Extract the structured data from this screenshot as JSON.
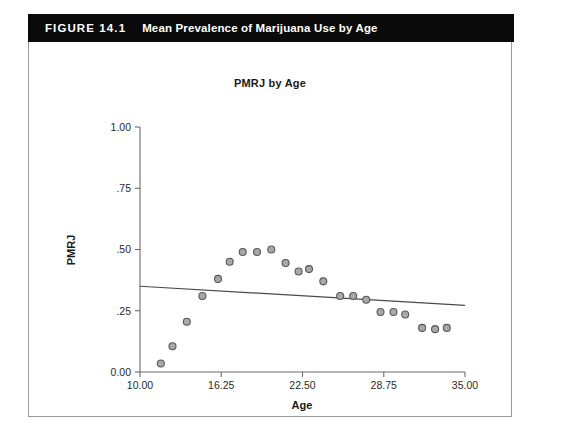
{
  "figure": {
    "number_label": "FIGURE 14.1",
    "caption": "Mean Prevalence of Marijuana Use by Age",
    "header_bg": "#0a0a0a",
    "header_fg": "#ffffff",
    "border_color": "#9a9a9a"
  },
  "chart_data": {
    "type": "scatter",
    "title": "PMRJ by Age",
    "xlabel": "Age",
    "ylabel": "PMRJ",
    "xlim": [
      10.0,
      35.0
    ],
    "ylim": [
      0.0,
      1.0
    ],
    "grid": false,
    "legend": null,
    "xticks": [
      10.0,
      16.25,
      22.5,
      28.75,
      35.0
    ],
    "xtick_labels": [
      "10.00",
      "16.25",
      "22.50",
      "28.75",
      "35.00"
    ],
    "yticks": [
      0.0,
      0.25,
      0.5,
      0.75,
      1.0
    ],
    "ytick_labels": [
      "0.00",
      ".25",
      ".50",
      ".75",
      "1.00"
    ],
    "marker": {
      "shape": "circle",
      "fill": "#a8a8a8",
      "edge": "#585858",
      "size_px": 7
    },
    "points": [
      {
        "x": 11.6,
        "y": 0.035
      },
      {
        "x": 12.5,
        "y": 0.105
      },
      {
        "x": 13.6,
        "y": 0.205
      },
      {
        "x": 14.8,
        "y": 0.31
      },
      {
        "x": 16.0,
        "y": 0.38
      },
      {
        "x": 16.9,
        "y": 0.45
      },
      {
        "x": 17.9,
        "y": 0.49
      },
      {
        "x": 19.0,
        "y": 0.49
      },
      {
        "x": 20.1,
        "y": 0.5
      },
      {
        "x": 21.2,
        "y": 0.445
      },
      {
        "x": 22.2,
        "y": 0.41
      },
      {
        "x": 23.0,
        "y": 0.42
      },
      {
        "x": 24.1,
        "y": 0.37
      },
      {
        "x": 25.4,
        "y": 0.31
      },
      {
        "x": 26.4,
        "y": 0.31
      },
      {
        "x": 27.4,
        "y": 0.295
      },
      {
        "x": 28.5,
        "y": 0.245
      },
      {
        "x": 29.5,
        "y": 0.245
      },
      {
        "x": 30.4,
        "y": 0.235
      },
      {
        "x": 31.7,
        "y": 0.18
      },
      {
        "x": 32.7,
        "y": 0.175
      },
      {
        "x": 33.6,
        "y": 0.18
      }
    ],
    "fit_line": {
      "type": "linear",
      "x_start": 10.0,
      "y_start": 0.35,
      "x_end": 35.0,
      "y_end": 0.272,
      "color": "#4a4a4a"
    }
  }
}
